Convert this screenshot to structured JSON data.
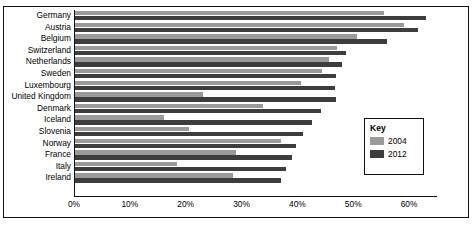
{
  "chart_data": {
    "type": "bar",
    "orientation": "horizontal",
    "title": "",
    "xlabel": "",
    "ylabel": "",
    "xlim": [
      0,
      65
    ],
    "grid": false,
    "legend_position": "inside-right",
    "categories": [
      "Germany",
      "Austria",
      "Belgium",
      "Switzerland",
      "Netherlands",
      "Sweden",
      "Luxembourg",
      "United Kingdom",
      "Denmark",
      "Iceland",
      "Slovenia",
      "Norway",
      "France",
      "Italy",
      "Ireland"
    ],
    "series": [
      {
        "name": "2004",
        "color": "#9a9a9a",
        "values": [
          55.3,
          59.0,
          50.5,
          47.0,
          45.4,
          44.3,
          40.5,
          23.0,
          33.6,
          16.0,
          20.5,
          36.8,
          28.8,
          18.3,
          28.3
        ]
      },
      {
        "name": "2012",
        "color": "#3d3d3d",
        "values": [
          62.8,
          61.5,
          55.8,
          48.5,
          47.8,
          46.8,
          46.5,
          46.8,
          44.0,
          42.5,
          40.8,
          39.5,
          38.8,
          37.8,
          36.8
        ]
      }
    ],
    "xticks": [
      0,
      10,
      20,
      30,
      40,
      50,
      60
    ],
    "xtick_labels": [
      "0%",
      "10%",
      "20%",
      "30%",
      "40%",
      "50%",
      "60%"
    ]
  },
  "legend": {
    "title": "Key",
    "entries": [
      {
        "label": "2004",
        "color": "#9a9a9a"
      },
      {
        "label": "2012",
        "color": "#3d3d3d"
      }
    ]
  }
}
